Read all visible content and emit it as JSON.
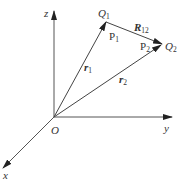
{
  "diagram": {
    "type": "vector-geometry",
    "axes": {
      "x": {
        "label": "x"
      },
      "y": {
        "label": "y"
      },
      "z": {
        "label": "z"
      }
    },
    "origin": {
      "label": "O"
    },
    "points": {
      "Q1": {
        "label": "Q",
        "subscript": "1"
      },
      "P1": {
        "label": "P",
        "subscript": "1"
      },
      "Q2": {
        "label": "Q",
        "subscript": "2"
      },
      "P2": {
        "label": "P",
        "subscript": "2"
      }
    },
    "vectors": {
      "r1": {
        "label": "r",
        "subscript": "1"
      },
      "r2": {
        "label": "r",
        "subscript": "2"
      },
      "R12": {
        "label": "R",
        "subscript": "12"
      }
    },
    "colors": {
      "line": "#555555",
      "text": "#333333",
      "background": "#ffffff"
    }
  }
}
